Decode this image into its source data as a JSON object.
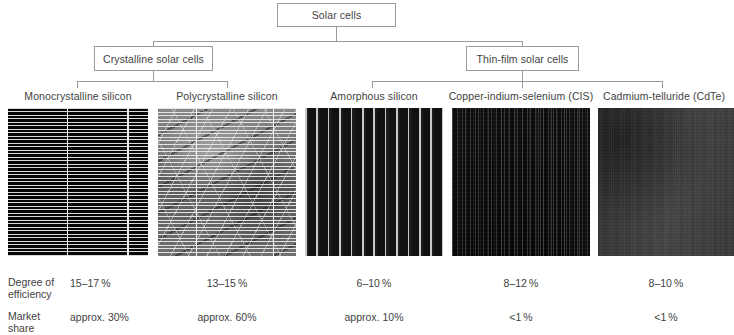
{
  "tree": {
    "root": {
      "label": "Solar cells"
    },
    "branches": [
      {
        "label": "Crystalline solar cells"
      },
      {
        "label": "Thin-film solar cells"
      }
    ]
  },
  "cells": [
    {
      "name": "monocrystalline-silicon",
      "label": "Monocrystalline silicon",
      "texture": "tex-mono",
      "efficiency": "15–17 %",
      "market_share": "approx. 30%"
    },
    {
      "name": "polycrystalline-silicon",
      "label": "Polycrystalline silicon",
      "texture": "tex-poly",
      "efficiency": "13–15 %",
      "market_share": "approx. 60%"
    },
    {
      "name": "amorphous-silicon",
      "label": "Amorphous silicon",
      "texture": "tex-amor",
      "efficiency": "6–10 %",
      "market_share": "approx. 10%"
    },
    {
      "name": "copper-indium-selenium-cis",
      "label": "Copper-indium-selenium (CIS)",
      "texture": "tex-cis",
      "efficiency": "8–12 %",
      "market_share": "<1 %"
    },
    {
      "name": "cadmium-telluride-cdte",
      "label": "Cadmium-telluride (CdTe)",
      "texture": "tex-cdte",
      "efficiency": "8–10 %",
      "market_share": "<1 %"
    }
  ],
  "rows": {
    "efficiency": {
      "line1": "Degree of",
      "line2": "efficiency"
    },
    "market_share": {
      "line1": "Market",
      "line2": "share"
    }
  },
  "colors": {
    "line": "#9a9a9a",
    "text": "#3f3f3f",
    "background": "#ffffff"
  }
}
